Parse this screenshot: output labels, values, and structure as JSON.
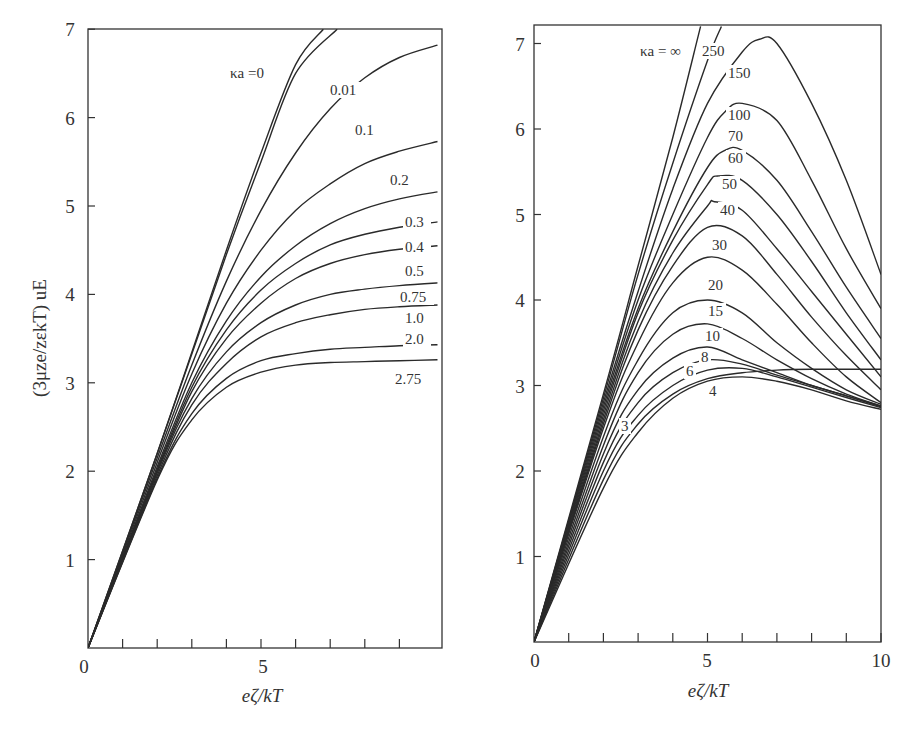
{
  "chart_data": [
    {
      "type": "line",
      "title": "",
      "xlabel": "eζ/kT",
      "ylabel": "(3μze/zεkT) uE",
      "xlim": [
        0,
        10.1
      ],
      "ylim": [
        0,
        7
      ],
      "grid": false,
      "x_ticks": [
        0,
        1,
        2,
        3,
        4,
        5,
        6,
        7,
        8,
        9
      ],
      "x_tick_labels": [
        {
          "x": 0,
          "label": "0"
        },
        {
          "x": 5,
          "label": "5"
        }
      ],
      "y_tick_labels": [
        "1",
        "2",
        "3",
        "4",
        "5",
        "6",
        "7"
      ],
      "parameter_label": "κa",
      "series": [
        {
          "name": "κa = 0",
          "label": "κa = 0",
          "x": [
            0,
            2,
            4,
            5,
            6,
            6.8
          ],
          "y": [
            0,
            2.2,
            4.5,
            5.6,
            6.6,
            7.0
          ]
        },
        {
          "name": "0.01",
          "label": "0.01",
          "x": [
            0,
            2,
            4,
            5,
            6,
            7.2
          ],
          "y": [
            0,
            2.2,
            4.45,
            5.5,
            6.5,
            7.0
          ]
        },
        {
          "name": "0.1",
          "label": "0.1",
          "x": [
            0,
            2,
            3,
            4,
            5,
            6,
            7,
            8,
            9,
            10.1
          ],
          "y": [
            0,
            2.15,
            3.2,
            4.15,
            4.95,
            5.6,
            6.1,
            6.45,
            6.68,
            6.82
          ]
        },
        {
          "name": "0.2",
          "label": "0.2",
          "x": [
            0,
            2,
            3,
            4,
            5,
            6,
            7,
            8,
            9,
            10.1
          ],
          "y": [
            0,
            2.1,
            3.1,
            3.9,
            4.5,
            4.95,
            5.25,
            5.48,
            5.62,
            5.73
          ]
        },
        {
          "name": "0.3",
          "label": "0.3",
          "x": [
            0,
            2,
            3,
            4,
            5,
            6,
            7,
            8,
            9,
            10.1
          ],
          "y": [
            0,
            2.05,
            3.0,
            3.7,
            4.2,
            4.55,
            4.8,
            4.97,
            5.08,
            5.16
          ]
        },
        {
          "name": "0.4",
          "label": "0.4",
          "x": [
            0,
            2,
            3,
            4,
            5,
            6,
            7,
            8,
            9,
            10.1
          ],
          "y": [
            0,
            2.02,
            2.95,
            3.6,
            4.05,
            4.35,
            4.56,
            4.68,
            4.76,
            4.82
          ]
        },
        {
          "name": "0.5",
          "label": "0.5",
          "x": [
            0,
            2,
            3,
            4,
            5,
            6,
            7,
            8,
            9,
            10.1
          ],
          "y": [
            0,
            2.0,
            2.9,
            3.5,
            3.9,
            4.18,
            4.35,
            4.45,
            4.51,
            4.55
          ]
        },
        {
          "name": "0.75",
          "label": "0.75",
          "x": [
            0,
            2,
            3,
            4,
            5,
            6,
            7,
            8,
            9,
            10.1
          ],
          "y": [
            0,
            1.98,
            2.82,
            3.35,
            3.68,
            3.88,
            4.0,
            4.06,
            4.1,
            4.13
          ]
        },
        {
          "name": "1.0",
          "label": "1.0",
          "x": [
            0,
            2,
            3,
            4,
            5,
            6,
            7,
            8,
            9,
            10.1
          ],
          "y": [
            0,
            1.95,
            2.75,
            3.22,
            3.52,
            3.68,
            3.77,
            3.83,
            3.86,
            3.88
          ]
        },
        {
          "name": "2.0",
          "label": "2.0",
          "x": [
            0,
            2,
            3,
            4,
            5,
            6,
            7,
            8,
            9,
            10.1
          ],
          "y": [
            0,
            1.92,
            2.65,
            3.05,
            3.25,
            3.33,
            3.38,
            3.4,
            3.42,
            3.43
          ]
        },
        {
          "name": "2.75",
          "label": "2.75",
          "x": [
            0,
            2,
            3,
            4,
            5,
            6,
            7,
            8,
            9,
            10.1
          ],
          "y": [
            0,
            1.9,
            2.58,
            2.95,
            3.12,
            3.2,
            3.23,
            3.24,
            3.25,
            3.26
          ]
        }
      ]
    },
    {
      "type": "line",
      "title": "",
      "xlabel": "eζ/kT",
      "ylabel": "",
      "xlim": [
        0,
        10
      ],
      "ylim": [
        0,
        7.2
      ],
      "grid": false,
      "x_ticks": [
        0,
        1,
        2,
        3,
        4,
        5,
        6,
        7,
        8,
        9,
        10
      ],
      "x_tick_labels": [
        {
          "x": 0,
          "label": "0"
        },
        {
          "x": 5,
          "label": "5"
        },
        {
          "x": 10,
          "label": "10"
        }
      ],
      "y_tick_labels": [
        "1",
        "2",
        "3",
        "4",
        "5",
        "6",
        "7"
      ],
      "parameter_label": "κa",
      "series": [
        {
          "name": "κa = ∞",
          "label": "κa = ∞",
          "x": [
            0,
            2,
            3,
            4,
            4.8
          ],
          "y": [
            0,
            2.9,
            4.4,
            5.9,
            7.2
          ]
        },
        {
          "name": "250",
          "label": "250",
          "x": [
            0,
            2,
            3,
            4,
            5,
            5.4
          ],
          "y": [
            0,
            2.85,
            4.3,
            5.6,
            6.8,
            7.2
          ]
        },
        {
          "name": "150",
          "label": "150",
          "x": [
            0,
            2,
            3,
            4,
            5,
            6,
            6.5,
            7,
            8,
            9,
            10
          ],
          "y": [
            0,
            2.8,
            4.1,
            5.3,
            6.3,
            6.9,
            7.05,
            7.0,
            6.3,
            5.4,
            4.3
          ]
        },
        {
          "name": "100",
          "label": "100",
          "x": [
            0,
            2,
            3,
            4,
            5,
            5.5,
            6,
            7,
            8,
            9,
            10
          ],
          "y": [
            0,
            2.75,
            4.0,
            5.0,
            5.9,
            6.2,
            6.3,
            6.1,
            5.4,
            4.6,
            3.9
          ]
        },
        {
          "name": "70",
          "label": "70",
          "x": [
            0,
            2,
            3,
            4,
            5,
            5.5,
            6,
            7,
            8,
            9,
            10
          ],
          "y": [
            0,
            2.7,
            3.9,
            4.8,
            5.55,
            5.75,
            5.75,
            5.4,
            4.8,
            4.15,
            3.55
          ]
        },
        {
          "name": "60",
          "label": "60",
          "x": [
            0,
            2,
            3,
            4,
            5,
            5.3,
            6,
            7,
            8,
            9,
            10
          ],
          "y": [
            0,
            2.65,
            3.85,
            4.7,
            5.35,
            5.45,
            5.4,
            5.0,
            4.45,
            3.85,
            3.3
          ]
        },
        {
          "name": "50",
          "label": "50",
          "x": [
            0,
            2,
            3,
            4,
            5,
            5.2,
            6,
            7,
            8,
            9,
            10
          ],
          "y": [
            0,
            2.6,
            3.75,
            4.55,
            5.1,
            5.15,
            5.05,
            4.6,
            4.1,
            3.6,
            3.1
          ]
        },
        {
          "name": "40",
          "label": "40",
          "x": [
            0,
            2,
            3,
            4,
            5,
            6,
            7,
            8,
            9,
            10
          ],
          "y": [
            0,
            2.55,
            3.65,
            4.4,
            4.85,
            4.75,
            4.3,
            3.8,
            3.35,
            2.95
          ]
        },
        {
          "name": "30",
          "label": "30",
          "x": [
            0,
            2,
            3,
            4,
            5,
            6,
            7,
            8,
            9,
            10
          ],
          "y": [
            0,
            2.5,
            3.5,
            4.2,
            4.5,
            4.35,
            3.95,
            3.5,
            3.1,
            2.8
          ]
        },
        {
          "name": "20",
          "label": "20",
          "x": [
            0,
            2,
            3,
            4,
            5,
            6,
            7,
            8,
            9,
            10
          ],
          "y": [
            0,
            2.4,
            3.3,
            3.85,
            4.0,
            3.85,
            3.5,
            3.2,
            2.95,
            2.78
          ]
        },
        {
          "name": "15",
          "label": "15",
          "x": [
            0,
            2,
            3,
            4,
            5,
            6,
            7,
            8,
            9,
            10
          ],
          "y": [
            0,
            2.3,
            3.15,
            3.6,
            3.72,
            3.55,
            3.3,
            3.08,
            2.9,
            2.76
          ]
        },
        {
          "name": "10",
          "label": "10",
          "x": [
            0,
            2,
            3,
            4,
            5,
            6,
            7,
            8,
            9,
            10
          ],
          "y": [
            0,
            2.2,
            2.95,
            3.32,
            3.45,
            3.3,
            3.15,
            3.0,
            2.88,
            2.76
          ]
        },
        {
          "name": "8",
          "label": "8",
          "x": [
            0,
            2,
            3,
            4,
            5,
            6,
            7,
            8,
            9,
            10
          ],
          "y": [
            0,
            2.1,
            2.8,
            3.15,
            3.3,
            3.25,
            3.12,
            3.0,
            2.88,
            2.75
          ]
        },
        {
          "name": "6",
          "label": "6",
          "x": [
            0,
            2,
            3,
            4,
            5,
            6,
            7,
            8,
            9,
            10
          ],
          "y": [
            0,
            2.0,
            2.65,
            3.0,
            3.18,
            3.2,
            3.1,
            2.98,
            2.86,
            2.74
          ]
        },
        {
          "name": "4",
          "label": "4",
          "x": [
            0,
            2,
            3,
            4,
            5,
            6,
            7,
            8,
            9,
            10
          ],
          "y": [
            0,
            1.9,
            2.55,
            2.9,
            3.08,
            3.15,
            3.18,
            3.19,
            3.19,
            3.19
          ]
        },
        {
          "name": "3",
          "label": "3",
          "x": [
            0,
            2,
            3,
            4,
            5,
            6,
            7,
            8,
            9,
            10
          ],
          "y": [
            0,
            1.8,
            2.45,
            2.85,
            3.05,
            3.1,
            3.05,
            2.95,
            2.82,
            2.72
          ]
        }
      ]
    }
  ],
  "left_chart": {
    "y_axis_label": "(3μze/zεkT) uE",
    "x_axis_label": "eζ/kT",
    "y_ticks": [
      "1",
      "2",
      "3",
      "4",
      "5",
      "6",
      "7"
    ],
    "x_ticks": [
      "0",
      "5"
    ],
    "curve_labels": [
      "κa =0",
      "0.01",
      "0.1",
      "0.2",
      "0.3",
      "0.4",
      "0.5",
      "0.75",
      "1.0",
      "2.0",
      "2.75"
    ]
  },
  "right_chart": {
    "x_axis_label": "eζ/kT",
    "y_ticks": [
      "1",
      "2",
      "3",
      "4",
      "5",
      "6",
      "7"
    ],
    "x_ticks": [
      "0",
      "5",
      "10"
    ],
    "curve_labels": [
      "κa = ∞",
      "250",
      "150",
      "100",
      "70",
      "60",
      "50",
      "40",
      "30",
      "20",
      "15",
      "10",
      "8",
      "6",
      "4",
      "3"
    ]
  }
}
